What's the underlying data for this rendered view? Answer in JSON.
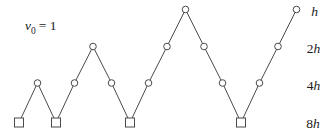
{
  "figure": {
    "initial_label": {
      "variable": "v",
      "subscript": "0",
      "relation": "= 1"
    },
    "colors": {
      "background": "#ffffff",
      "stroke": "#4a4a4a",
      "marker_fill": "#ffffff",
      "text": "#1c1c1c"
    },
    "marker": {
      "circle_radius": 3.3,
      "square_size": 9,
      "stroke_width": 1
    },
    "path_vertices": [
      {
        "x": 19,
        "y": 122.5,
        "shape": "square",
        "level": "8h"
      },
      {
        "x": 37.5,
        "y": 83,
        "shape": "circle",
        "level": "4h"
      },
      {
        "x": 56,
        "y": 122.5,
        "shape": "square",
        "level": "8h"
      },
      {
        "x": 74.5,
        "y": 83,
        "shape": "circle",
        "level": "4h"
      },
      {
        "x": 93,
        "y": 46.5,
        "shape": "circle",
        "level": "2h"
      },
      {
        "x": 111.5,
        "y": 83,
        "shape": "circle",
        "level": "4h"
      },
      {
        "x": 130,
        "y": 122.5,
        "shape": "square",
        "level": "8h"
      },
      {
        "x": 148.5,
        "y": 83,
        "shape": "circle",
        "level": "4h"
      },
      {
        "x": 167,
        "y": 46.5,
        "shape": "circle",
        "level": "2h"
      },
      {
        "x": 185.5,
        "y": 9.5,
        "shape": "circle",
        "level": "h"
      },
      {
        "x": 204,
        "y": 46.5,
        "shape": "circle",
        "level": "2h"
      },
      {
        "x": 222.5,
        "y": 83,
        "shape": "circle",
        "level": "4h"
      },
      {
        "x": 241,
        "y": 122.5,
        "shape": "square",
        "level": "8h"
      },
      {
        "x": 259.5,
        "y": 83,
        "shape": "circle",
        "level": "4h"
      },
      {
        "x": 278,
        "y": 46.5,
        "shape": "circle",
        "level": "2h"
      },
      {
        "x": 296.5,
        "y": 9.5,
        "shape": "circle",
        "level": "h"
      }
    ],
    "level_labels": [
      {
        "coefficient": "",
        "variable": "h",
        "x": 314.5,
        "y": 11.5
      },
      {
        "coefficient": "2",
        "variable": "h",
        "x": 313.5,
        "y": 48.5
      },
      {
        "coefficient": "4",
        "variable": "h",
        "x": 313.5,
        "y": 85.5
      },
      {
        "coefficient": "8",
        "variable": "h",
        "x": 313,
        "y": 123.5
      }
    ]
  }
}
